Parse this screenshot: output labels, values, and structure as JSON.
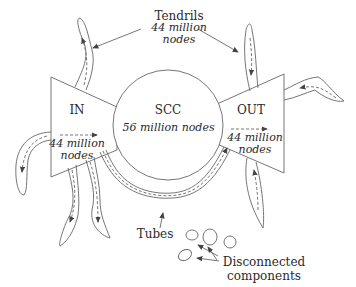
{
  "diagram": {
    "type": "bow-tie web graph structure",
    "colors": {
      "stroke": "#555555",
      "arrow": "#444444",
      "text": "#2a2a2a",
      "background": "#ffffff"
    },
    "scc": {
      "title": "SCC",
      "count": "56 million nodes"
    },
    "in": {
      "title": "IN",
      "count_line1": "44 million",
      "count_line2": "nodes"
    },
    "out": {
      "title": "OUT",
      "count_line1": "44 million",
      "count_line2": "nodes"
    },
    "tendrils": {
      "title": "Tendrils",
      "count_line1": "44 million",
      "count_line2": "nodes"
    },
    "tubes": {
      "title": "Tubes"
    },
    "disconnected": {
      "line1": "Disconnected",
      "line2": "components"
    }
  }
}
